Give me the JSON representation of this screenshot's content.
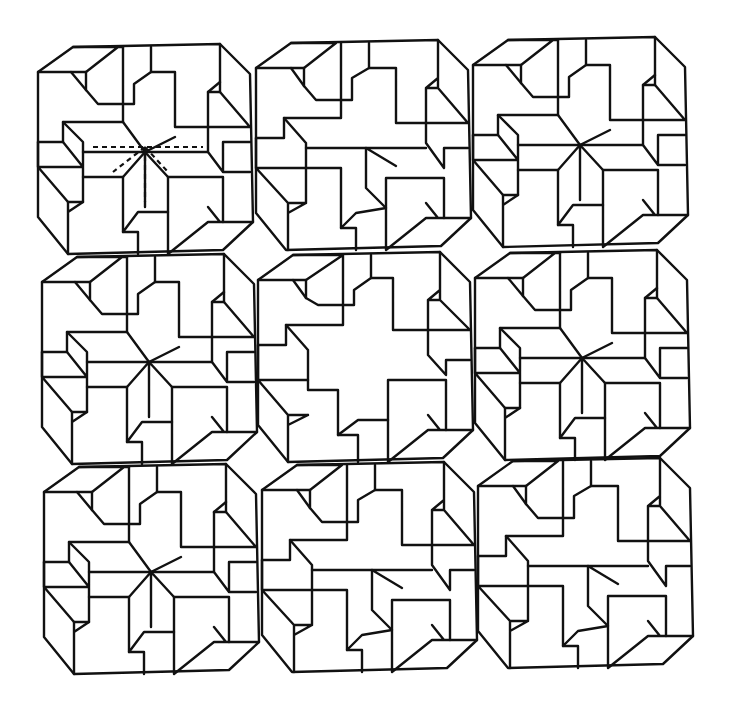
{
  "figure": {
    "grid": {
      "rows": 3,
      "cols": 3
    },
    "line_color": "#111111",
    "background": "#ffffff",
    "panels": [
      {
        "row": 0,
        "col": 0,
        "variant": "pinwheel",
        "dashed_guides": true
      },
      {
        "row": 0,
        "col": 1,
        "variant": "open-center-left"
      },
      {
        "row": 0,
        "col": 2,
        "variant": "pinwheel"
      },
      {
        "row": 1,
        "col": 0,
        "variant": "pinwheel"
      },
      {
        "row": 1,
        "col": 1,
        "variant": "hollow-cross"
      },
      {
        "row": 1,
        "col": 2,
        "variant": "pinwheel"
      },
      {
        "row": 2,
        "col": 0,
        "variant": "pinwheel"
      },
      {
        "row": 2,
        "col": 1,
        "variant": "open-center-bottom"
      },
      {
        "row": 2,
        "col": 2,
        "variant": "open-center-right"
      }
    ]
  }
}
